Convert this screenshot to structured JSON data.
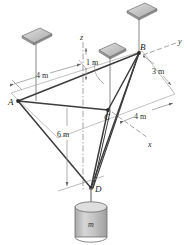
{
  "figure": {
    "type": "engineering-statics-free-body-diagram",
    "background": "#ffffff",
    "line_color": "#3c3c3c",
    "thin_line_color": "#9a9a9a",
    "plate_fill": "#c9c9c9",
    "plate_edge": "#6e6e6e",
    "cylinder_fill": "#bfbfbf",
    "cylinder_edge": "#6b6b6b"
  },
  "points": [
    {
      "id": "A",
      "label": "A",
      "x": 18,
      "y": 101
    },
    {
      "id": "B",
      "label": "B",
      "x": 139,
      "y": 53
    },
    {
      "id": "C",
      "label": "C",
      "x": 108,
      "y": 110
    },
    {
      "id": "D",
      "label": "D",
      "x": 91,
      "y": 188
    }
  ],
  "axes": [
    {
      "id": "z",
      "label": "z",
      "style": "dash-dot-vertical"
    },
    {
      "id": "y",
      "label": "y",
      "style": "dashed-upper-right"
    },
    {
      "id": "x",
      "label": "x",
      "style": "dashed-lower-right"
    }
  ],
  "dimensions": [
    {
      "id": "dim-4m-left",
      "label": "4 m",
      "orientation": "horizontal-left",
      "value": 4,
      "unit": "m"
    },
    {
      "id": "dim-1m-top",
      "label": "1 m",
      "orientation": "vertical-top",
      "value": 1,
      "unit": "m"
    },
    {
      "id": "dim-3m-right",
      "label": "3 m",
      "orientation": "diagonal-right",
      "value": 3,
      "unit": "m"
    },
    {
      "id": "dim-4m-right",
      "label": "4 m",
      "orientation": "diagonal-right",
      "value": 4,
      "unit": "m"
    },
    {
      "id": "dim-6m-drop",
      "label": "6 m",
      "orientation": "vertical-drop",
      "value": 6,
      "unit": "m"
    }
  ],
  "load": {
    "id": "hanging-mass",
    "label": "m",
    "shape": "cylinder"
  },
  "supports": [
    {
      "id": "plate-a",
      "attached_to": "A"
    },
    {
      "id": "plate-b",
      "attached_to": "B"
    },
    {
      "id": "plate-middle",
      "attached_to": "z-axis"
    }
  ]
}
